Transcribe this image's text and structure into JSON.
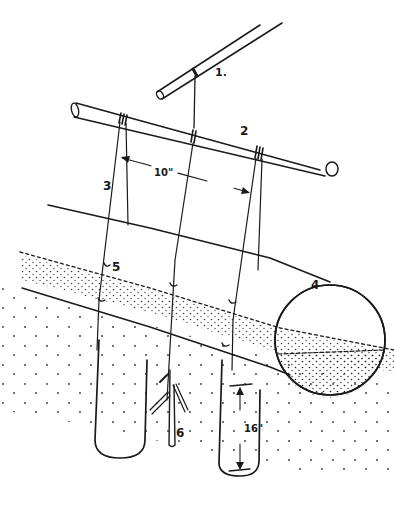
{
  "figure": {
    "type": "technical line drawing",
    "ink_color": "#1a1a1a",
    "background": "#ffffff"
  },
  "labels": {
    "support_pole": "1.",
    "crossbar": "2",
    "snare_line": "3",
    "log": "4",
    "attachment": "5",
    "trigger_stick": "6"
  },
  "dimensions": {
    "loop_spacing": "10\"",
    "loop_height": "16\""
  }
}
